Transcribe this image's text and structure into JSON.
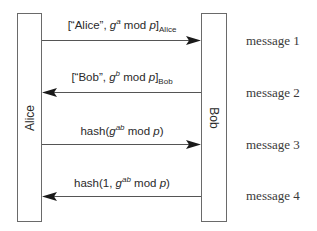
{
  "diagram": {
    "type": "sequence",
    "parties": {
      "alice": {
        "label": "Alice"
      },
      "bob": {
        "label": "Bob"
      }
    },
    "messages": [
      {
        "id": "message-1",
        "label": "message 1",
        "direction": "alice-to-bob",
        "content": {
          "prefix": "[“Alice”, ",
          "base": "g",
          "exponent": "a",
          "middle": " mod ",
          "modulus": "p",
          "close": "]",
          "subscript": "Alice"
        }
      },
      {
        "id": "message-2",
        "label": "message 2",
        "direction": "bob-to-alice",
        "content": {
          "prefix": "[“Bob”, ",
          "base": "g",
          "exponent": "b",
          "middle": " mod ",
          "modulus": "p",
          "close": "]",
          "subscript": "Bob"
        }
      },
      {
        "id": "message-3",
        "label": "message 3",
        "direction": "alice-to-bob",
        "content": {
          "prefix": "hash(",
          "base": "g",
          "exponent": "ab",
          "middle": " mod ",
          "modulus": "p",
          "close": ")"
        }
      },
      {
        "id": "message-4",
        "label": "message 4",
        "direction": "bob-to-alice",
        "content": {
          "prefix": "hash(1, ",
          "base": "g",
          "exponent": "ab",
          "middle": " mod ",
          "modulus": "p",
          "close": ")"
        }
      }
    ],
    "colors": {
      "line": "#555555",
      "box_border": "#6a6a6a",
      "text": "#2a2a2a"
    }
  }
}
